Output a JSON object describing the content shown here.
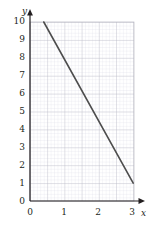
{
  "chart_data": {
    "type": "line",
    "title": "",
    "xlabel": "x",
    "ylabel": "y",
    "xlim": [
      0,
      3.15
    ],
    "ylim": [
      0,
      10.4
    ],
    "xticks": [
      0,
      1,
      2,
      3
    ],
    "xtick_labels": [
      "0",
      "1",
      "2",
      "3"
    ],
    "yticks": [
      0,
      1,
      2,
      3,
      4,
      5,
      6,
      7,
      8,
      9,
      10
    ],
    "ytick_labels": [
      "0",
      "1",
      "2",
      "3",
      "4",
      "5",
      "6",
      "7",
      "8",
      "9",
      "10"
    ],
    "grid": true,
    "minor_grid": true,
    "minor_steps_per_unit_x": 10,
    "minor_steps_per_unit_y": 5,
    "legend": null,
    "series": [
      {
        "name": "line",
        "points": [
          {
            "x": 0.4,
            "y": 10.0
          },
          {
            "x": 3.0,
            "y": 1.0
          }
        ],
        "slope": -3.46,
        "intercept": 11.38,
        "color": "#4d4d4d",
        "width": 1.6
      }
    ]
  },
  "style": {
    "background": "#ffffff",
    "axis_color": "#231f20",
    "major_grid_color": "#b9b9c4",
    "minor_grid_color": "#dcdce4",
    "plot_fill": "#ffffff",
    "text_color": "#231f20"
  },
  "geometry": {
    "origin_x": 30,
    "origin_y": 201,
    "unit_x": 34.4,
    "unit_y": 17.9,
    "plot_right": 134,
    "plot_top": 22
  }
}
